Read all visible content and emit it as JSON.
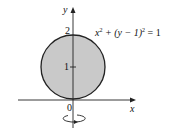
{
  "diagram": {
    "axes": {
      "x_label": "x",
      "y_label": "y",
      "origin_label": "0"
    },
    "ticks": {
      "y_top": "2",
      "y_mid": "1"
    },
    "equation": {
      "x": "x",
      "sup1": "2",
      "mid": " + (y − 1)",
      "sup2": "2",
      "rhs": " = 1"
    },
    "circle": {
      "fill": "#c8c8c8",
      "stroke": "#222222"
    },
    "rotation_indicator": "rotation about y-axis"
  }
}
